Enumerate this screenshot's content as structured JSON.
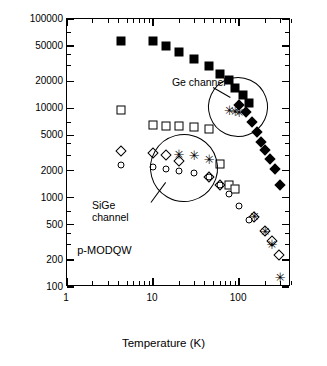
{
  "chart_data": {
    "type": "scatter",
    "title": "",
    "xlabel": "Temperature (K)",
    "ylabel": "Hall mobility cm2/Vs",
    "xscale": "log",
    "yscale": "log",
    "xlim": [
      1,
      400
    ],
    "ylim": [
      100,
      100000
    ],
    "xticks": [
      "1",
      "10",
      "100"
    ],
    "yticks": [
      "100",
      "200",
      "500",
      "1000",
      "2000",
      "5000",
      "10000",
      "20000",
      "50000",
      "100000"
    ],
    "grid": false,
    "legend_position": "none",
    "annotations": [
      {
        "text": "Ge channel",
        "x": 45,
        "y": 17000
      },
      {
        "text": "SiGe\nchannel",
        "x": 5,
        "y": 700
      },
      {
        "text": "p-MODQW",
        "x": 3.2,
        "y": 230
      }
    ],
    "series": [
      {
        "name": "Ge channel filled squares",
        "marker": "filled-square",
        "x": [
          4.2,
          10,
          14,
          20,
          30,
          45,
          60,
          77,
          90,
          110,
          130
        ],
        "y": [
          57000,
          57000,
          50000,
          43000,
          36000,
          30000,
          24000,
          21000,
          17000,
          14000,
          11500
        ]
      },
      {
        "name": "Ge channel filled diamonds",
        "marker": "filled-diamond",
        "x": [
          100,
          120,
          140,
          160,
          180,
          200,
          230,
          260,
          300
        ],
        "y": [
          11000,
          9000,
          7000,
          5500,
          4200,
          3400,
          2700,
          2100,
          1400
        ]
      },
      {
        "name": "Ge channel stars",
        "marker": "star",
        "x": [
          77,
          90,
          100
        ],
        "y": [
          9500,
          9300,
          9000
        ]
      },
      {
        "name": "SiGe channel open squares",
        "marker": "open-square",
        "x": [
          4.2,
          10,
          14,
          20,
          30,
          45,
          60,
          77,
          90
        ],
        "y": [
          9500,
          6500,
          6400,
          6400,
          6200,
          5800,
          2400,
          1400,
          1250
        ]
      },
      {
        "name": "SiGe channel open diamonds",
        "marker": "open-diamond",
        "x": [
          4.2,
          10,
          14,
          20,
          45,
          60,
          150,
          200,
          240,
          290
        ],
        "y": [
          3300,
          3200,
          3000,
          2600,
          1700,
          1400,
          600,
          420,
          330,
          230
        ]
      },
      {
        "name": "SiGe channel open circles",
        "marker": "open-circle",
        "x": [
          4.2,
          10,
          14,
          20,
          30,
          45,
          60,
          77,
          100,
          130
        ],
        "y": [
          2300,
          2200,
          2100,
          2000,
          1900,
          1700,
          1400,
          1100,
          800,
          560
        ]
      },
      {
        "name": "SiGe channel stars",
        "marker": "star",
        "x": [
          20,
          30,
          45,
          150,
          200,
          240,
          300
        ],
        "y": [
          3100,
          3000,
          2700,
          620,
          420,
          300,
          130
        ]
      }
    ]
  }
}
